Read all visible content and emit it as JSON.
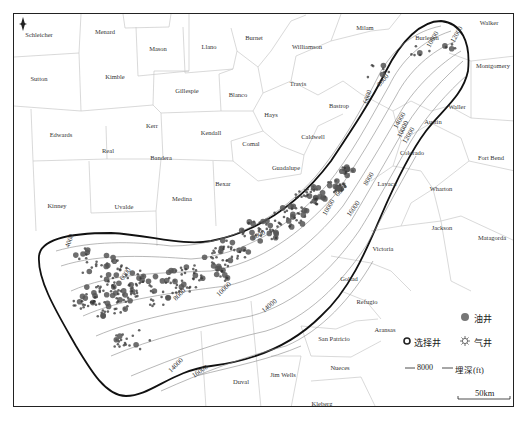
{
  "map": {
    "north_arrow": "north-arrow",
    "counties": [
      {
        "name": "Schleicher",
        "x": 38,
        "y": 33
      },
      {
        "name": "Menard",
        "x": 104,
        "y": 30
      },
      {
        "name": "Mason",
        "x": 157,
        "y": 47
      },
      {
        "name": "Llano",
        "x": 208,
        "y": 45
      },
      {
        "name": "Burnet",
        "x": 253,
        "y": 36
      },
      {
        "name": "Williamson",
        "x": 306,
        "y": 45
      },
      {
        "name": "Milam",
        "x": 364,
        "y": 26
      },
      {
        "name": "Walker",
        "x": 488,
        "y": 21
      },
      {
        "name": "Burleson",
        "x": 426,
        "y": 36
      },
      {
        "name": "Montgomery",
        "x": 492,
        "y": 64
      },
      {
        "name": "Sutton",
        "x": 38,
        "y": 77
      },
      {
        "name": "Kimble",
        "x": 114,
        "y": 75
      },
      {
        "name": "Gillespie",
        "x": 186,
        "y": 89
      },
      {
        "name": "Blanco",
        "x": 237,
        "y": 93
      },
      {
        "name": "Travis",
        "x": 297,
        "y": 82
      },
      {
        "name": "Bastrop",
        "x": 338,
        "y": 104
      },
      {
        "name": "Hays",
        "x": 270,
        "y": 113
      },
      {
        "name": "Waller",
        "x": 456,
        "y": 105
      },
      {
        "name": "Austin",
        "x": 432,
        "y": 120
      },
      {
        "name": "Edwards",
        "x": 60,
        "y": 133
      },
      {
        "name": "Kerr",
        "x": 151,
        "y": 124
      },
      {
        "name": "Kendall",
        "x": 210,
        "y": 131
      },
      {
        "name": "Comal",
        "x": 250,
        "y": 142
      },
      {
        "name": "Caldwell",
        "x": 312,
        "y": 135
      },
      {
        "name": "Real",
        "x": 107,
        "y": 149
      },
      {
        "name": "Bandera",
        "x": 160,
        "y": 156
      },
      {
        "name": "Guadalupe",
        "x": 285,
        "y": 166
      },
      {
        "name": "Colorado",
        "x": 411,
        "y": 151
      },
      {
        "name": "Fort Bend",
        "x": 490,
        "y": 156
      },
      {
        "name": "Lavaca",
        "x": 386,
        "y": 182
      },
      {
        "name": "Bexar",
        "x": 222,
        "y": 182
      },
      {
        "name": "Wharton",
        "x": 440,
        "y": 187
      },
      {
        "name": "Kinney",
        "x": 56,
        "y": 204
      },
      {
        "name": "Uvalde",
        "x": 123,
        "y": 205
      },
      {
        "name": "Medina",
        "x": 181,
        "y": 197
      },
      {
        "name": "Jackson",
        "x": 441,
        "y": 226
      },
      {
        "name": "Matagorda",
        "x": 491,
        "y": 236
      },
      {
        "name": "Victoria",
        "x": 382,
        "y": 247
      },
      {
        "name": "Goliad",
        "x": 348,
        "y": 277
      },
      {
        "name": "Refugio",
        "x": 366,
        "y": 300
      },
      {
        "name": "Aransas",
        "x": 384,
        "y": 328
      },
      {
        "name": "San Patricio",
        "x": 333,
        "y": 337
      },
      {
        "name": "Nueces",
        "x": 339,
        "y": 366
      },
      {
        "name": "Jim Wells",
        "x": 282,
        "y": 373
      },
      {
        "name": "Duval",
        "x": 240,
        "y": 380
      },
      {
        "name": "Kleberg",
        "x": 321,
        "y": 402
      }
    ],
    "contour_labels": [
      {
        "text": "4000",
        "x": 68,
        "y": 247,
        "rot": -70
      },
      {
        "text": "6000",
        "x": 122,
        "y": 280,
        "rot": -55
      },
      {
        "text": "8000",
        "x": 175,
        "y": 300,
        "rot": -45
      },
      {
        "text": "10000",
        "x": 218,
        "y": 296,
        "rot": -45
      },
      {
        "text": "14000",
        "x": 263,
        "y": 312,
        "rot": -40
      },
      {
        "text": "16000",
        "x": 193,
        "y": 377,
        "rot": -35
      },
      {
        "text": "14000",
        "x": 170,
        "y": 372,
        "rot": -45
      },
      {
        "text": "8000",
        "x": 252,
        "y": 239,
        "rot": -25
      },
      {
        "text": "6000",
        "x": 337,
        "y": 196,
        "rot": -50
      },
      {
        "text": "8000",
        "x": 366,
        "y": 185,
        "rot": -60
      },
      {
        "text": "16000",
        "x": 349,
        "y": 216,
        "rot": -55
      },
      {
        "text": "10000",
        "x": 325,
        "y": 215,
        "rot": -60
      },
      {
        "text": "6000",
        "x": 366,
        "y": 103,
        "rot": -70
      },
      {
        "text": "8000",
        "x": 379,
        "y": 86,
        "rot": -50
      },
      {
        "text": "10000",
        "x": 400,
        "y": 137,
        "rot": -65
      },
      {
        "text": "12000",
        "x": 405,
        "y": 143,
        "rot": -60
      },
      {
        "text": "14000",
        "x": 396,
        "y": 128,
        "rot": -60
      },
      {
        "text": "10000",
        "x": 429,
        "y": 47,
        "rot": -60
      },
      {
        "text": "12000",
        "x": 453,
        "y": 42,
        "rot": -60
      }
    ]
  },
  "legend": {
    "oil_well": "油井",
    "selected_well": "选择井",
    "gas_well": "气井",
    "contour_value": "8000",
    "contour_label": "埋深(ft)",
    "scale": "50km"
  }
}
